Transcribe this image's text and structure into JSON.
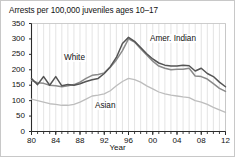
{
  "chart_data": {
    "type": "line",
    "title": "Arrests per 100,000 juveniles ages 10–17",
    "xlabel": "Year",
    "ylabel": "",
    "xlim": [
      1980,
      2012
    ],
    "ylim": [
      0,
      350
    ],
    "yticks": [
      0,
      50,
      100,
      150,
      200,
      250,
      300,
      350
    ],
    "xticks": [
      1980,
      1984,
      1988,
      1992,
      1996,
      2000,
      2004,
      2008,
      2012
    ],
    "xticklabels": [
      "80",
      "84",
      "88",
      "92",
      "96",
      "00",
      "04",
      "08",
      "12"
    ],
    "grid": "vertical",
    "legend": "inline-labels",
    "x": [
      1980,
      1981,
      1982,
      1983,
      1984,
      1985,
      1986,
      1987,
      1988,
      1989,
      1990,
      1991,
      1992,
      1993,
      1994,
      1995,
      1996,
      1997,
      1998,
      1999,
      2000,
      2001,
      2002,
      2003,
      2004,
      2005,
      2006,
      2007,
      2008,
      2009,
      2010,
      2011,
      2012
    ],
    "series": [
      {
        "name": "Amer. Indian",
        "color": "#555555",
        "label_x": 148,
        "label_y": 33,
        "values": [
          172,
          152,
          178,
          150,
          178,
          148,
          152,
          150,
          155,
          162,
          168,
          172,
          188,
          210,
          240,
          285,
          305,
          292,
          272,
          252,
          235,
          222,
          215,
          212,
          212,
          215,
          213,
          196,
          205,
          188,
          178,
          160,
          145
        ]
      },
      {
        "name": "White",
        "color": "#8a8a8a",
        "label_x": 62,
        "label_y": 52,
        "values": [
          165,
          158,
          156,
          150,
          148,
          145,
          148,
          152,
          160,
          172,
          182,
          185,
          190,
          208,
          232,
          262,
          300,
          290,
          268,
          248,
          228,
          212,
          205,
          200,
          202,
          202,
          205,
          180,
          178,
          170,
          155,
          140,
          130
        ]
      },
      {
        "name": "Asian",
        "color": "#bdbdbd",
        "label_x": 93,
        "label_y": 100,
        "values": [
          105,
          100,
          95,
          90,
          88,
          85,
          85,
          88,
          95,
          105,
          115,
          118,
          122,
          132,
          148,
          162,
          172,
          168,
          160,
          148,
          138,
          128,
          122,
          118,
          115,
          112,
          110,
          100,
          95,
          88,
          78,
          70,
          62
        ]
      }
    ]
  }
}
